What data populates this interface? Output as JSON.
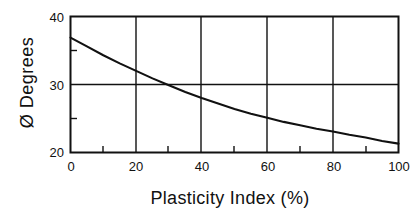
{
  "chart_data": {
    "type": "line",
    "title": "",
    "xlabel": "Plasticity  Index (%)",
    "ylabel": "Ø  Degrees",
    "xlim": [
      0,
      100
    ],
    "ylim": [
      20,
      40
    ],
    "grid": true,
    "legend": null,
    "xticks": [
      {
        "value": 0,
        "label": "0"
      },
      {
        "value": 20,
        "label": "20"
      },
      {
        "value": 40,
        "label": "40"
      },
      {
        "value": 60,
        "label": "60"
      },
      {
        "value": 80,
        "label": "80"
      },
      {
        "value": 100,
        "label": "100"
      }
    ],
    "yticks": [
      {
        "value": 20,
        "label": "20"
      },
      {
        "value": 30,
        "label": "30"
      },
      {
        "value": 40,
        "label": "40"
      }
    ],
    "x_minor_ticks": [
      10,
      30,
      50,
      70,
      90
    ],
    "y_minor_ticks": [
      25,
      35
    ],
    "gridlines_x": [
      20,
      40,
      60,
      80
    ],
    "gridlines_y": [
      30
    ],
    "series": [
      {
        "name": "friction angle vs plasticity index",
        "color": "#111111",
        "x": [
          0,
          5,
          10,
          15,
          20,
          25,
          30,
          35,
          40,
          45,
          50,
          55,
          60,
          65,
          70,
          75,
          80,
          85,
          90,
          95,
          100
        ],
        "y": [
          36.9,
          35.6,
          34.3,
          33.1,
          32.0,
          30.9,
          29.9,
          28.9,
          28.0,
          27.2,
          26.4,
          25.7,
          25.1,
          24.5,
          24.0,
          23.5,
          23.1,
          22.6,
          22.2,
          21.7,
          21.3
        ]
      }
    ]
  },
  "axes": {
    "y_tick_labels": [
      "40",
      "30",
      "20"
    ],
    "x_tick_labels": [
      "0",
      "20",
      "40",
      "60",
      "80",
      "100"
    ],
    "y_title": "Ø  Degrees",
    "x_title": "Plasticity  Index (%)"
  },
  "style": {
    "axis_color": "#111111",
    "grid_color": "#111111",
    "curve_color": "#111111",
    "background": "#ffffff"
  }
}
